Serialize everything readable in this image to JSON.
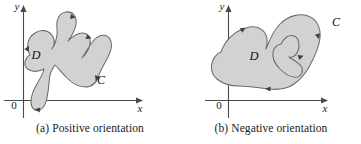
{
  "figure": {
    "background_color": "#ffffff",
    "region_fill_color": "#d2d2d2",
    "curve_stroke_color": "#6b6b6b",
    "axis_color": "#4a4a4a",
    "text_color": "#1a1a1a"
  },
  "panels": [
    {
      "id": "a",
      "caption": "(a) Positive orientation",
      "axes": {
        "x_label": "x",
        "y_label": "y",
        "origin_label": "0"
      },
      "labels": {
        "region": "D",
        "curve": "C"
      },
      "orientation": "counterclockwise",
      "arrow_count": 4
    },
    {
      "id": "b",
      "caption": "(b) Negative orientation",
      "axes": {
        "x_label": "x",
        "y_label": "y",
        "origin_label": "0"
      },
      "labels": {
        "region": "D",
        "curve": "C"
      },
      "orientation": "clockwise",
      "arrow_count": 4
    }
  ]
}
